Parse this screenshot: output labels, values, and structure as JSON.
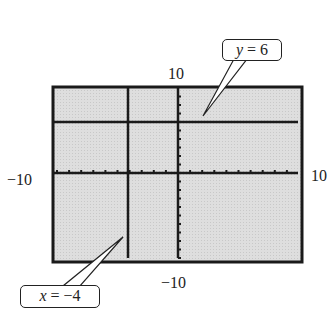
{
  "figure": {
    "window": {
      "xmin": -10,
      "xmax": 10,
      "ymin": -10,
      "ymax": 10
    },
    "labels": {
      "ymax": "10",
      "ymin": "−10",
      "xmin": "−10",
      "xmax": "10"
    },
    "callouts": [
      {
        "var": "y",
        "eq": " = 6"
      },
      {
        "var": "x",
        "eq": " = −4"
      }
    ]
  },
  "chart_data": {
    "type": "line",
    "title": "",
    "xlabel": "",
    "ylabel": "",
    "xlim": [
      -10,
      10
    ],
    "ylim": [
      -10,
      10
    ],
    "series": [
      {
        "name": "y = 6",
        "kind": "horizontal",
        "value": 6
      },
      {
        "name": "x = -4",
        "kind": "vertical",
        "value": -4
      }
    ],
    "ticks": "every 1 unit on both axes",
    "background": "#d9d9d9"
  }
}
